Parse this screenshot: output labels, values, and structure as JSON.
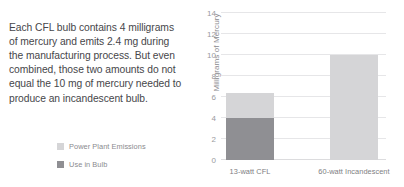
{
  "annotation": {
    "text": "Each CFL bulb contains 4 milligrams of mercury and emits 2.4 mg during the manufacturing process. But even combined, those two amounts do not equal the 10 mg of mercury needed to produce an incandescent bulb."
  },
  "legend": {
    "position": "left-panel-bottom",
    "items": [
      {
        "label": "Power Plant Emissions",
        "color": "#d5d5d7",
        "key": "power_plant_emissions"
      },
      {
        "label": "Use in Bulb",
        "color": "#8f8f93",
        "key": "use_in_bulb"
      }
    ]
  },
  "chart_data": {
    "type": "bar",
    "stacked": true,
    "title": "",
    "xlabel": "",
    "ylabel": "Milligrams of Mercury",
    "categories": [
      "13-watt CFL",
      "60-watt Incandescent"
    ],
    "series": [
      {
        "name": "Use in Bulb",
        "color": "#8f8f93",
        "values": [
          4.0,
          0
        ]
      },
      {
        "name": "Power Plant Emissions",
        "color": "#d5d5d7",
        "values": [
          2.4,
          10.0
        ]
      }
    ],
    "totals": [
      6.4,
      10.0
    ],
    "ylim": [
      0,
      14
    ],
    "yticks": [
      0,
      2,
      4,
      6,
      8,
      10,
      12,
      14
    ],
    "ytick_labels": [
      "0",
      "2",
      "4",
      "6",
      "8",
      "10",
      "12",
      "14"
    ],
    "grid": true,
    "legend_position": "outside-left"
  },
  "colors": {
    "light_gray": "#d5d5d7",
    "dark_gray": "#8f8f93",
    "gridline": "#e6e6e8",
    "text_body": "#46464a",
    "text_muted": "#8a8a8e",
    "background": "#ffffff"
  }
}
